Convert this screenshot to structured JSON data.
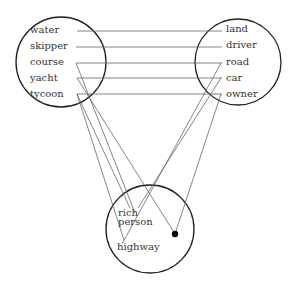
{
  "left_circle": {
    "words": [
      "water",
      "skipper",
      "course",
      "yacht",
      "tycoon"
    ]
  },
  "right_circle": {
    "words": [
      "land",
      "driver",
      "road",
      "car",
      "owner"
    ]
  },
  "bottom_circle": {
    "words": [
      "rich",
      "person",
      "highway"
    ]
  },
  "colors": {
    "circle": "#222222",
    "line": "#666666",
    "dot": "#000000",
    "text": "#333333"
  }
}
